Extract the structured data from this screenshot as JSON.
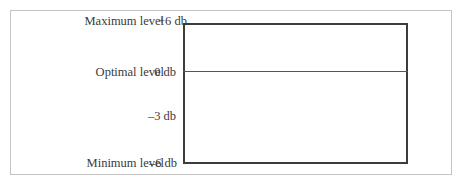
{
  "diagram": {
    "levels": [
      {
        "name": "Maximum level",
        "db": "+6 db"
      },
      {
        "name": "Optimal level",
        "db": "0 db"
      },
      {
        "name": "",
        "db": "–3 db"
      },
      {
        "name": "Minimum level",
        "db": "–6 db"
      }
    ],
    "colors": {
      "frame": "#c4c4c4",
      "box": "#3c3c3c",
      "text": "#3a3a3a"
    }
  }
}
